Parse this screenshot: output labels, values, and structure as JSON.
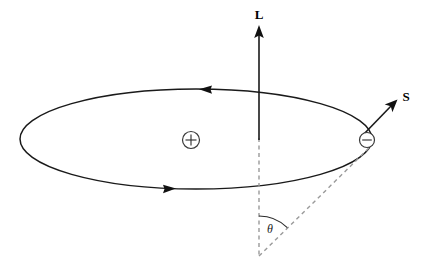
{
  "figure": {
    "width": 425,
    "height": 269,
    "background_color": "#ffffff"
  },
  "labels": {
    "angular_momentum": "L",
    "spin": "S",
    "angle": "θ",
    "nucleus_charge": "+",
    "electron_charge": "−"
  },
  "colors": {
    "stroke": "#1a1a1a",
    "dashed_stroke": "#9a9a9a",
    "arc_stroke": "#2b2b2b",
    "charge_outline": "#3a3a3a",
    "fill": "#ffffff"
  },
  "geometry": {
    "orbit": {
      "center_x": 196,
      "center_y": 139,
      "radius_x": 176,
      "radius_y": 50,
      "direction": "counterclockwise-as-drawn"
    },
    "nucleus": {
      "center_x": 191,
      "center_y": 140,
      "radius": 8.5
    },
    "electron": {
      "center_x": 367,
      "center_y": 140,
      "radius": 7.5
    },
    "angular_momentum_vector": {
      "tail_x": 259,
      "tail_y": 140,
      "head_x": 259,
      "head_y": 28
    },
    "spin_vector": {
      "tail_x": 363,
      "tail_y": 135,
      "head_x": 396,
      "head_y": 101
    },
    "vertical_dashed_axis": {
      "x": 259,
      "top_y": 140,
      "bottom_y": 256
    },
    "radial_dashed_line": {
      "x1": 259,
      "y1": 256,
      "x2": 372,
      "y2": 146
    },
    "angle_arc": {
      "center_x": 259,
      "center_y": 256,
      "radius": 40,
      "start_deg": -90,
      "end_deg": -45
    },
    "orbit_arrow_top": {
      "x": 207,
      "y": 90,
      "points": "left"
    },
    "orbit_arrow_bottom": {
      "x": 167,
      "y": 188,
      "points": "right"
    }
  },
  "label_positions": {
    "angular_momentum": {
      "x": 259,
      "y": 18
    },
    "spin": {
      "x": 406,
      "y": 101
    },
    "angle": {
      "x": 271,
      "y": 233
    },
    "nucleus": {
      "x": 191,
      "y": 145
    },
    "electron": {
      "x": 367,
      "y": 145
    }
  }
}
